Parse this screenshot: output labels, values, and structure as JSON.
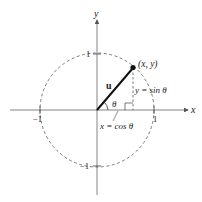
{
  "diagram": {
    "axes": {
      "x_label": "x",
      "y_label": "y",
      "ticks": {
        "x_pos": "1",
        "x_neg": "−1",
        "y_pos": "1",
        "y_neg": "−1"
      }
    },
    "point_label": "(x, y)",
    "vector_label": "u",
    "angle_label": "θ",
    "horizontal_label": "x = cos θ",
    "vertical_label": "y = sin θ",
    "colors": {
      "line": "#222222",
      "axis": "#555555",
      "circle": "#444444"
    }
  }
}
